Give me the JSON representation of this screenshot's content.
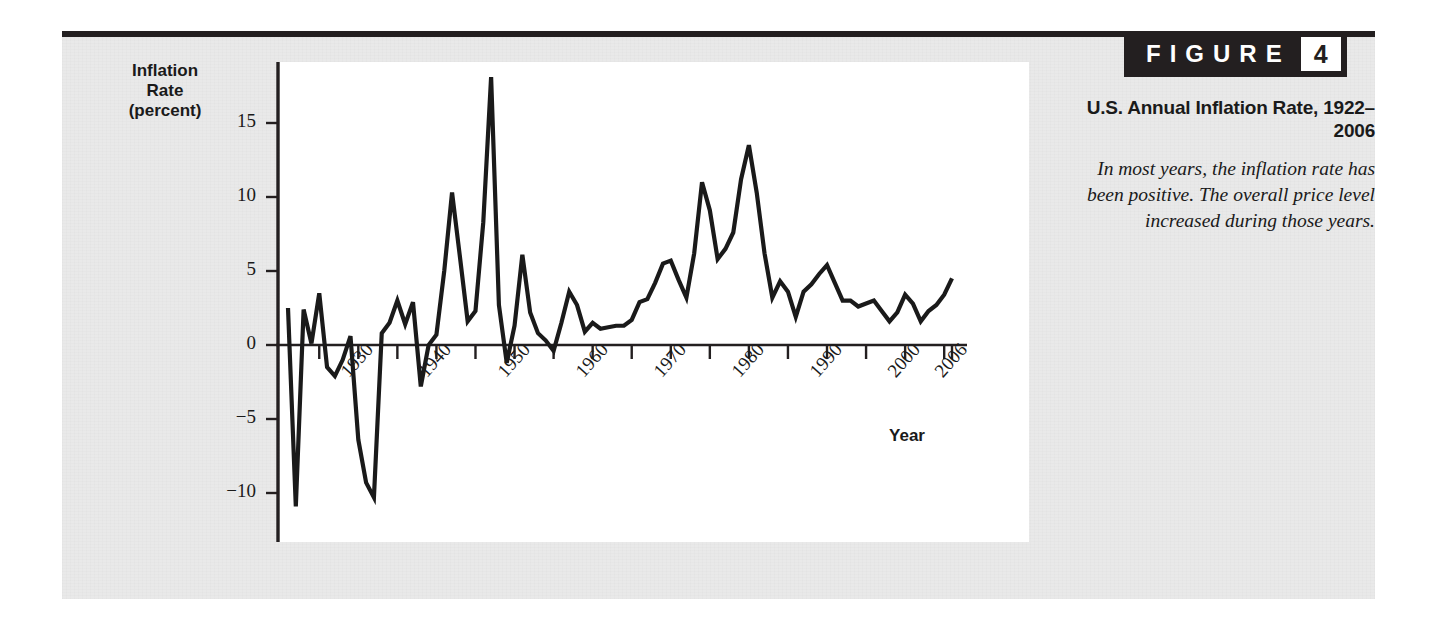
{
  "figure": {
    "badge_word": "FIGURE",
    "badge_number": "4",
    "caption_title": "U.S. Annual Inflation Rate, 1922–2006",
    "caption_body": "In most years, the inflation rate has been positive. The overall price level increased during those years."
  },
  "colors": {
    "panel_background": "#e9e9e9",
    "plot_background": "#ffffff",
    "ink": "#231f20",
    "line": "#1a1a1a"
  },
  "chart_data": {
    "type": "line",
    "title": "U.S. Annual Inflation Rate, 1922–2006",
    "xlabel": "Year",
    "ylabel": "Inflation Rate (percent)",
    "ylim": [
      -13,
      19
    ],
    "xlim": [
      1921,
      2006
    ],
    "grid": false,
    "legend": null,
    "ytick_labels": [
      "15",
      "10",
      "5",
      "0",
      "−5",
      "−10"
    ],
    "ytick_values": [
      15,
      10,
      5,
      0,
      -5,
      -10
    ],
    "xtick_labels": [
      "1930",
      "1940",
      "1950",
      "1960",
      "1970",
      "1980",
      "1990",
      "2000",
      "2006"
    ],
    "xtick_values": [
      1930,
      1940,
      1950,
      1960,
      1970,
      1980,
      1990,
      2000,
      2006
    ],
    "xtick_minor_values": [
      1925,
      1935,
      1945,
      1955,
      1965,
      1975,
      1985,
      1995,
      2005
    ],
    "x": [
      1921,
      1922,
      1923,
      1924,
      1925,
      1926,
      1927,
      1928,
      1929,
      1930,
      1931,
      1932,
      1933,
      1934,
      1935,
      1936,
      1937,
      1938,
      1939,
      1940,
      1941,
      1942,
      1943,
      1944,
      1945,
      1946,
      1947,
      1948,
      1949,
      1950,
      1951,
      1952,
      1953,
      1954,
      1955,
      1956,
      1957,
      1958,
      1959,
      1960,
      1961,
      1962,
      1963,
      1964,
      1965,
      1966,
      1967,
      1968,
      1969,
      1970,
      1971,
      1972,
      1973,
      1974,
      1975,
      1976,
      1977,
      1978,
      1979,
      1980,
      1981,
      1982,
      1983,
      1984,
      1985,
      1986,
      1987,
      1988,
      1989,
      1990,
      1991,
      1992,
      1993,
      1994,
      1995,
      1996,
      1997,
      1998,
      1999,
      2000,
      2001,
      2002,
      2003,
      2004,
      2005,
      2006
    ],
    "values": [
      2.5,
      -10.9,
      2.4,
      0.1,
      3.5,
      -1.5,
      -2.1,
      -1.0,
      0.6,
      -6.4,
      -9.3,
      -10.3,
      0.8,
      1.5,
      3.0,
      1.4,
      2.9,
      -2.8,
      0.0,
      0.7,
      5.0,
      10.3,
      6.0,
      1.6,
      2.3,
      8.3,
      18.1,
      2.7,
      -1.2,
      1.3,
      6.1,
      2.2,
      0.8,
      0.3,
      -0.4,
      1.5,
      3.6,
      2.7,
      0.9,
      1.5,
      1.1,
      1.2,
      1.3,
      1.3,
      1.7,
      2.9,
      3.1,
      4.2,
      5.5,
      5.7,
      4.4,
      3.2,
      6.2,
      11.0,
      9.1,
      5.8,
      6.5,
      7.6,
      11.2,
      13.5,
      10.3,
      6.2,
      3.2,
      4.3,
      3.6,
      1.9,
      3.6,
      4.1,
      4.8,
      5.4,
      4.2,
      3.0,
      3.0,
      2.6,
      2.8,
      3.0,
      2.3,
      1.6,
      2.2,
      3.4,
      2.8,
      1.6,
      2.3,
      2.7,
      3.4,
      4.5
    ],
    "annotations": []
  }
}
